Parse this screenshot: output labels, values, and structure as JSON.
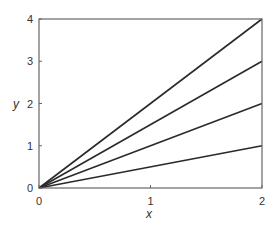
{
  "chart_data": {
    "type": "line",
    "title": "",
    "xlabel": "x",
    "ylabel": "y",
    "xlim": [
      0,
      2
    ],
    "ylim": [
      0,
      4
    ],
    "xticks": [
      "0",
      "1",
      "2"
    ],
    "yticks": [
      "0",
      "1",
      "2",
      "3",
      "4"
    ],
    "grid": false,
    "legend": null,
    "series": [
      {
        "name": "y = 2x",
        "x": [
          0,
          2
        ],
        "y": [
          0,
          4
        ]
      },
      {
        "name": "y = 1.5x",
        "x": [
          0,
          2
        ],
        "y": [
          0,
          3
        ]
      },
      {
        "name": "y = x",
        "x": [
          0,
          2
        ],
        "y": [
          0,
          2
        ]
      },
      {
        "name": "y = 0.5x",
        "x": [
          0,
          2
        ],
        "y": [
          0,
          1
        ]
      }
    ],
    "colors": {
      "line": "#2a2a2a",
      "axes": "#555555",
      "text": "#333333"
    }
  }
}
